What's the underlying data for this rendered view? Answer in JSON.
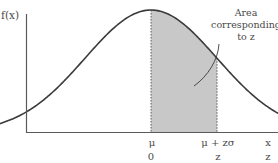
{
  "figure": {
    "y_axis_label": "f(x)",
    "annotation_lines": [
      "Area",
      "corresponding",
      "to z"
    ],
    "x_scale_labels": {
      "mean": "μ",
      "mean_plus": "μ + zσ",
      "var": "x"
    },
    "z_scale_labels": {
      "mean": "0",
      "z": "z",
      "var": "z"
    },
    "colors": {
      "curve": "#3a3a3a",
      "axis": "#5a5a5a",
      "shade": "#c8c8c8",
      "text": "#4a4a4a"
    },
    "shaded_region": {
      "from_z": 0,
      "to_z": 1.0
    }
  },
  "chart_data": {
    "type": "area",
    "title": "",
    "xlabel": "x",
    "ylabel": "f(x)",
    "distribution": "normal",
    "mean_label": "μ",
    "shaded_interval_z": [
      0,
      1.0
    ],
    "x_tick_labels": [
      "μ",
      "μ + zσ"
    ],
    "z_tick_labels": [
      "0",
      "z"
    ],
    "annotation": "Area corresponding to z",
    "z_range": [
      -2.3,
      2.3
    ]
  }
}
